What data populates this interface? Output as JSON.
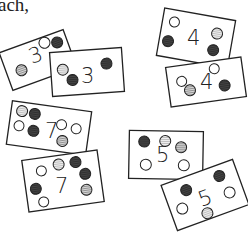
{
  "header_text": "ach,",
  "colors": {
    "outline": "#222222",
    "empty": "#ffffff",
    "dark": "#3a3a3a",
    "striped": "#8a8a8a",
    "light_striped": "#b5b5b5"
  },
  "card_pairs": [
    {
      "number": "3",
      "cards": [
        {
          "label": "3",
          "dots": [
            "striped",
            "empty",
            "dark"
          ]
        },
        {
          "label": "3",
          "dots": [
            "light_striped",
            "dark",
            "dark"
          ]
        }
      ]
    },
    {
      "number": "4",
      "cards": [
        {
          "label": "4",
          "dots": [
            "empty",
            "light_striped",
            "dark",
            "dark"
          ]
        },
        {
          "label": "4",
          "dots": [
            "empty",
            "striped",
            "dark",
            "empty"
          ]
        }
      ]
    },
    {
      "number": "7",
      "cards": [
        {
          "label": "7",
          "dots": [
            "light_striped",
            "dark",
            "empty",
            "empty",
            "empty",
            "dark",
            "striped"
          ]
        },
        {
          "label": "7",
          "dots": [
            "empty",
            "light_striped",
            "dark",
            "dark",
            "dark",
            "striped",
            "empty"
          ]
        }
      ]
    },
    {
      "number": "5",
      "cards": [
        {
          "label": "5",
          "dots": [
            "dark",
            "light_striped",
            "striped",
            "empty",
            "empty"
          ]
        },
        {
          "label": "5",
          "dots": [
            "dark",
            "dark",
            "empty",
            "empty",
            "light_striped"
          ]
        }
      ]
    }
  ]
}
